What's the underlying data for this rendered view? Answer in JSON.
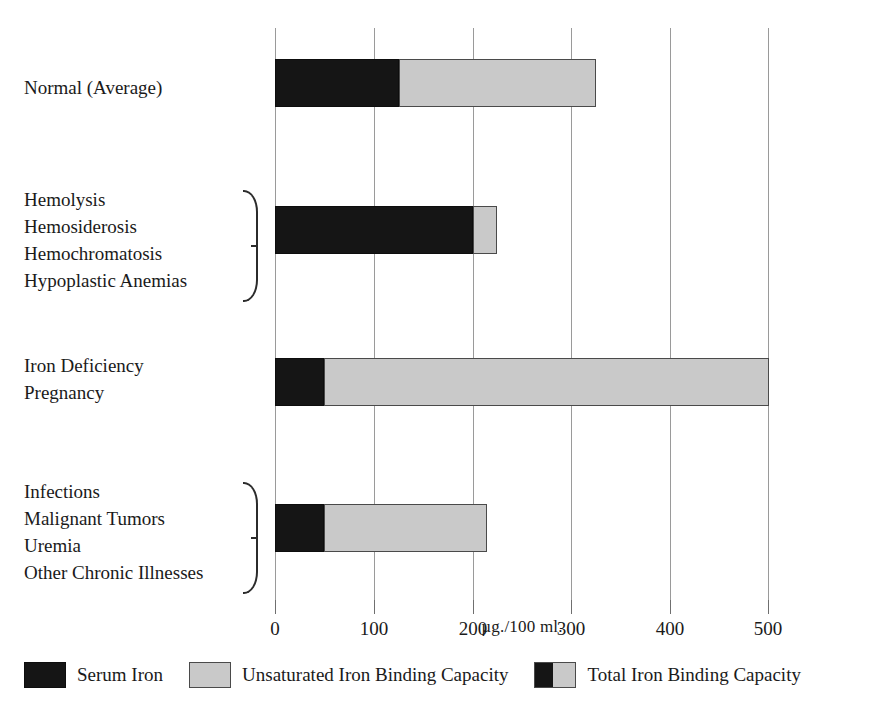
{
  "chart_data": {
    "type": "bar",
    "orientation": "horizontal",
    "stacked": true,
    "title": "",
    "xlabel": "µg./100 ml.",
    "ylabel": "",
    "xlim": [
      0,
      500
    ],
    "xticks": [
      0,
      100,
      200,
      300,
      400,
      500
    ],
    "xtick_labels": [
      "0",
      "100",
      "200",
      "300",
      "400",
      "500"
    ],
    "grid": true,
    "legend_position": "bottom",
    "categories": [
      "Normal (Average)",
      "Hemolysis / Hemosiderosis / Hemochromatosis / Hypoplastic Anemias",
      "Iron Deficiency / Pregnancy",
      "Infections / Malignant Tumors / Uremia / Other Chronic Illnesses"
    ],
    "series": [
      {
        "name": "Serum Iron",
        "color": "#151515",
        "values": [
          125,
          200,
          50,
          50
        ]
      },
      {
        "name": "Unsaturated Iron Binding Capacity",
        "color": "#c9c9c9",
        "values": [
          200,
          25,
          450,
          165
        ]
      }
    ],
    "totals": {
      "name": "Total Iron Binding Capacity",
      "values": [
        325,
        225,
        500,
        215
      ]
    }
  },
  "axis": {
    "ticks": [
      {
        "label": "0",
        "value": 0
      },
      {
        "label": "100",
        "value": 100
      },
      {
        "label": "200",
        "value": 200
      },
      {
        "label": "300",
        "value": 300
      },
      {
        "label": "400",
        "value": 400
      },
      {
        "label": "500",
        "value": 500
      }
    ],
    "title": "µg./100 ml."
  },
  "rows": [
    {
      "id": "normal",
      "label_lines": [
        "Normal (Average)"
      ],
      "brace": false,
      "serum_iron": 125,
      "unsaturated": 200,
      "total": 325
    },
    {
      "id": "iron-overload",
      "label_lines": [
        "Hemolysis",
        "Hemosiderosis",
        "Hemochromatosis",
        "Hypoplastic Anemias"
      ],
      "brace": true,
      "serum_iron": 200,
      "unsaturated": 25,
      "total": 225
    },
    {
      "id": "iron-deficiency",
      "label_lines": [
        "Iron Deficiency",
        "Pregnancy"
      ],
      "brace": false,
      "serum_iron": 50,
      "unsaturated": 450,
      "total": 500
    },
    {
      "id": "chronic-disease",
      "label_lines": [
        "Infections",
        "Malignant Tumors",
        "Uremia",
        "Other Chronic Illnesses"
      ],
      "brace": true,
      "serum_iron": 50,
      "unsaturated": 165,
      "total": 215
    }
  ],
  "legend": {
    "items": [
      {
        "label": "Serum Iron",
        "swatch": "black",
        "color": "#151515"
      },
      {
        "label": "Unsaturated Iron Binding Capacity",
        "swatch": "gray",
        "color": "#c9c9c9"
      },
      {
        "label": "Total Iron Binding Capacity",
        "swatch": "split",
        "color": "#151515"
      }
    ]
  }
}
